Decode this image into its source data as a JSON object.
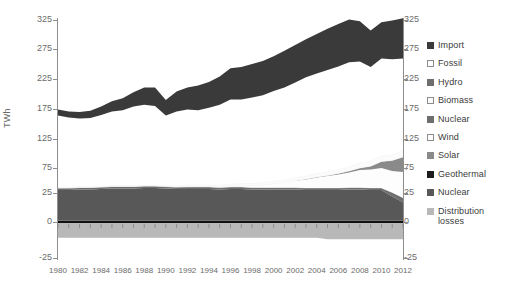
{
  "axes": {
    "ylabel": "TWh",
    "yticks": [
      325,
      275,
      225,
      175,
      125,
      75,
      25,
      0,
      -25
    ],
    "ytick_labels": [
      "325",
      "275",
      "225",
      "175",
      "125",
      "75",
      "25",
      "0",
      "-25"
    ],
    "xtick_labels": [
      "1980",
      "1982",
      "1984",
      "1986",
      "1988",
      "1990",
      "1992",
      "1994",
      "1996",
      "1998",
      "2000",
      "2002",
      "2004",
      "2006",
      "2008",
      "2010",
      "2012"
    ]
  },
  "legend": {
    "items": [
      {
        "label": "Import",
        "color": "#3a3a3a",
        "border": "#3a3a3a"
      },
      {
        "label": "Fossil",
        "color": "#ffffff",
        "border": "#8c8c8c"
      },
      {
        "label": "Hydro",
        "color": "#6e6e6e",
        "border": "#6e6e6e"
      },
      {
        "label": "Biomass",
        "color": "#fbfbfb",
        "border": "#8c8c8c"
      },
      {
        "label": "Nuclear",
        "color": "#6e6e6e",
        "border": "#6e6e6e"
      },
      {
        "label": "Wind",
        "color": "#fdfdfd",
        "border": "#8c8c8c"
      },
      {
        "label": "Solar",
        "color": "#8a8a8a",
        "border": "#8a8a8a"
      },
      {
        "label": "Geothermal",
        "color": "#1d1d1d",
        "border": "#1d1d1d"
      },
      {
        "label": "Nuclear",
        "color": "#585858",
        "border": "#585858"
      },
      {
        "label": "Distribution losses",
        "color": "#b8b8b8",
        "border": "#b8b8b8"
      }
    ]
  },
  "chart_data": {
    "type": "area",
    "title": "",
    "xlabel": "",
    "ylabel": "TWh",
    "ylim": [
      -25,
      325
    ],
    "xlim": [
      1980,
      2012
    ],
    "grid": false,
    "legend_position": "right",
    "stacked": true,
    "x": [
      1980,
      1981,
      1982,
      1983,
      1984,
      1985,
      1986,
      1987,
      1988,
      1989,
      1990,
      1991,
      1992,
      1993,
      1994,
      1995,
      1996,
      1997,
      1998,
      1999,
      2000,
      2001,
      2002,
      2003,
      2004,
      2005,
      2006,
      2007,
      2008,
      2009,
      2010,
      2011,
      2012
    ],
    "series": [
      {
        "name": "Distribution losses",
        "color": "#b8b8b8",
        "values": [
          -11,
          -11,
          -11,
          -11,
          -11,
          -11,
          -11,
          -11,
          -11,
          -11,
          -11,
          -11,
          -11,
          -11,
          -11,
          -11,
          -11,
          -11,
          -11,
          -11,
          -11,
          -11,
          -11,
          -11,
          -11,
          -12,
          -12,
          -12,
          -12,
          -12,
          -12,
          -12,
          -12
        ]
      },
      {
        "name": "Geothermal",
        "color": "#1d1d1d",
        "values": [
          1,
          1,
          1,
          1,
          1,
          1,
          1,
          1,
          1,
          1,
          1,
          1,
          1,
          1,
          1,
          1,
          1,
          1,
          1,
          1,
          1,
          1,
          1,
          1,
          1,
          1,
          1,
          1,
          1,
          1,
          1,
          1,
          1
        ]
      },
      {
        "name": "Nuclear",
        "color": "#585858",
        "values": [
          30,
          30,
          31,
          31,
          32,
          33,
          33,
          33,
          34,
          34,
          33,
          32,
          32,
          32,
          32,
          31,
          32,
          32,
          31,
          31,
          31,
          31,
          31,
          30,
          30,
          30,
          30,
          31,
          31,
          30,
          30,
          21,
          16
        ]
      },
      {
        "name": "Hydro",
        "color": "#6e6e6e",
        "values": [
          4,
          4,
          4,
          4,
          4,
          4,
          4,
          4,
          4,
          4,
          4,
          4,
          4,
          4,
          4,
          4,
          4,
          4,
          4,
          4,
          4,
          4,
          4,
          4,
          4,
          4,
          4,
          4,
          4,
          4,
          4,
          4,
          4
        ]
      },
      {
        "name": "Wind",
        "color": "#fdfdfd",
        "values": [
          0,
          0,
          0,
          0,
          0,
          0,
          0,
          0,
          0,
          0,
          0,
          0,
          1,
          1,
          1,
          2,
          2,
          3,
          4,
          5,
          8,
          10,
          14,
          17,
          21,
          24,
          27,
          30,
          35,
          37,
          40,
          43,
          46
        ]
      },
      {
        "name": "Solar",
        "color": "#8a8a8a",
        "values": [
          0,
          0,
          0,
          0,
          0,
          0,
          0,
          0,
          0,
          0,
          0,
          0,
          0,
          0,
          0,
          0,
          0,
          0,
          0,
          0,
          0,
          0,
          0,
          1,
          1,
          1,
          2,
          3,
          4,
          6,
          11,
          19,
          27
        ]
      },
      {
        "name": "Biomass",
        "color": "#fbfbfb",
        "values": [
          2,
          2,
          2,
          2,
          2,
          2,
          2,
          2,
          2,
          2,
          2,
          2,
          3,
          3,
          3,
          3,
          4,
          4,
          4,
          5,
          5,
          5,
          6,
          6,
          7,
          7,
          8,
          8,
          9,
          9,
          10,
          10,
          11
        ]
      },
      {
        "name": "Fossil",
        "color": "#ffffff",
        "values": [
          127,
          124,
          121,
          122,
          126,
          131,
          133,
          139,
          141,
          139,
          124,
          132,
          133,
          132,
          136,
          141,
          148,
          147,
          150,
          152,
          156,
          160,
          163,
          169,
          170,
          173,
          174,
          176,
          170,
          158,
          163,
          160,
          154
        ]
      },
      {
        "name": "Import",
        "color": "#3a3a3a",
        "values": [
          10,
          10,
          11,
          12,
          14,
          17,
          20,
          24,
          29,
          31,
          26,
          33,
          37,
          41,
          43,
          47,
          52,
          54,
          56,
          57,
          58,
          61,
          63,
          64,
          67,
          70,
          72,
          73,
          69,
          62,
          62,
          66,
          69
        ]
      }
    ],
    "totals": [
      163,
      160,
      159,
      161,
      168,
      177,
      182,
      192,
      199,
      199,
      179,
      192,
      200,
      203,
      209,
      217,
      230,
      232,
      238,
      242,
      250,
      259,
      268,
      278,
      285,
      293,
      300,
      307,
      305,
      288,
      303,
      306,
      310
    ],
    "annotations": []
  }
}
